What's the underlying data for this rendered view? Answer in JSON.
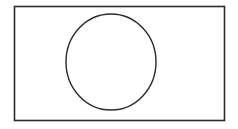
{
  "diagram": {
    "background": "#ffffff",
    "stroke_color": "#2a2a2a",
    "rectangle": {
      "x": 14.5,
      "y": 6.5,
      "width": 210,
      "height": 114,
      "stroke_width": 1.6,
      "fill": "#ffffff"
    },
    "ellipse": {
      "cx": 111,
      "cy": 62,
      "rx": 45,
      "ry": 48,
      "stroke_width": 1.4,
      "fill": "none"
    }
  }
}
